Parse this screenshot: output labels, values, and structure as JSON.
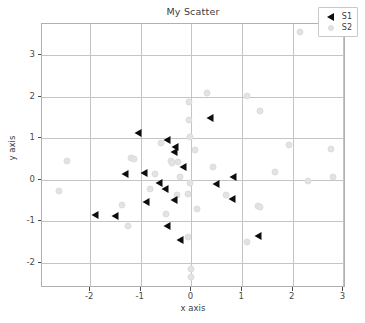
{
  "chart_data": {
    "type": "scatter",
    "title": "My Scatter",
    "xlabel": "x axis",
    "ylabel": "y axis",
    "xlim": [
      -2.95,
      3.05
    ],
    "ylim": [
      -2.6,
      3.75
    ],
    "xticks": [
      "-2",
      "-1",
      "0",
      "1",
      "2",
      "3"
    ],
    "xtick_values": [
      -2,
      -1,
      0,
      1,
      2,
      3
    ],
    "yticks": [
      "3",
      "2",
      "1",
      "0",
      "-1",
      "-2"
    ],
    "ytick_values": [
      3,
      2,
      1,
      0,
      -1,
      -2
    ],
    "grid": true,
    "legend_position": "upper right",
    "series": [
      {
        "name": "S1",
        "marker": "left-triangle",
        "color": "#0d0d0d",
        "points": [
          [
            -1.06,
            1.12
          ],
          [
            0.37,
            1.5
          ],
          [
            -0.48,
            0.96
          ],
          [
            -0.32,
            0.8
          ],
          [
            -0.35,
            0.68
          ],
          [
            -0.16,
            0.32
          ],
          [
            -1.32,
            0.14
          ],
          [
            -0.93,
            0.17
          ],
          [
            0.82,
            0.07
          ],
          [
            -0.64,
            -0.08
          ],
          [
            0.49,
            -0.11
          ],
          [
            -0.52,
            -0.22
          ],
          [
            -0.34,
            -0.48
          ],
          [
            -0.89,
            -0.52
          ],
          [
            0.8,
            -0.46
          ],
          [
            -1.91,
            -0.84
          ],
          [
            -1.5,
            -0.88
          ],
          [
            -0.49,
            -1.12
          ],
          [
            1.31,
            -1.34
          ],
          [
            -0.22,
            -1.45
          ]
        ]
      },
      {
        "name": "S2",
        "marker": "circle",
        "color": "#e3e3e3",
        "points": [
          [
            2.14,
            3.56
          ],
          [
            0.3,
            2.1
          ],
          [
            1.1,
            2.02
          ],
          [
            -0.04,
            1.88
          ],
          [
            1.36,
            1.66
          ],
          [
            -0.05,
            1.43
          ],
          [
            -0.02,
            1.04
          ],
          [
            -0.6,
            0.88
          ],
          [
            1.93,
            0.85
          ],
          [
            2.75,
            0.75
          ],
          [
            0.07,
            0.72
          ],
          [
            -1.19,
            0.53
          ],
          [
            -1.13,
            0.5
          ],
          [
            -0.4,
            0.46
          ],
          [
            -0.39,
            0.4
          ],
          [
            -0.26,
            0.42
          ],
          [
            -2.46,
            0.45
          ],
          [
            0.43,
            0.3
          ],
          [
            1.64,
            0.18
          ],
          [
            -0.71,
            0.14
          ],
          [
            -0.22,
            0.08
          ],
          [
            2.8,
            0.06
          ],
          [
            2.3,
            -0.03
          ],
          [
            -0.02,
            -0.07
          ],
          [
            -2.62,
            -0.27
          ],
          [
            -0.82,
            -0.22
          ],
          [
            -0.29,
            -0.37
          ],
          [
            -0.07,
            -0.34
          ],
          [
            0.68,
            -0.36
          ],
          [
            -1.37,
            -0.6
          ],
          [
            1.32,
            -0.62
          ],
          [
            1.36,
            -0.65
          ],
          [
            -0.51,
            -0.81
          ],
          [
            0.11,
            -0.71
          ],
          [
            -1.25,
            -1.12
          ],
          [
            1.1,
            -1.5
          ],
          [
            -0.06,
            -1.37
          ],
          [
            0.0,
            -2.15
          ],
          [
            0.0,
            -2.33
          ]
        ]
      }
    ]
  }
}
